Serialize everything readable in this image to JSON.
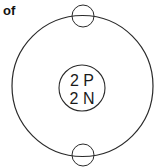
{
  "caption": "of",
  "diagram": {
    "type": "atom-model",
    "element": "helium",
    "nucleus": {
      "line1": "2 P",
      "line2": "2 N"
    },
    "electrons": 2,
    "colors": {
      "stroke": "#2a2a2a",
      "background": "#ffffff",
      "text": "#1a1a1a"
    }
  }
}
